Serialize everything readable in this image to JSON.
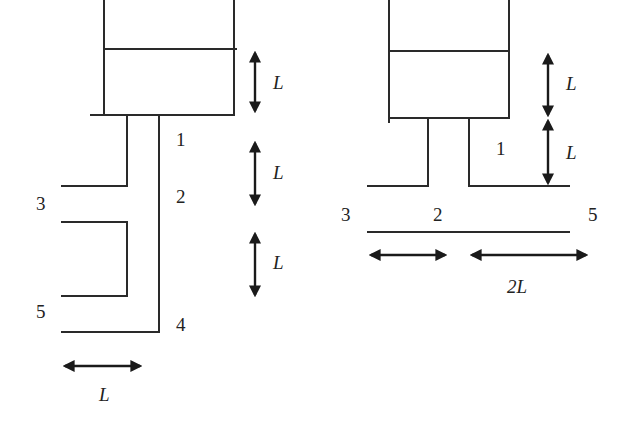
{
  "figure_left": {
    "title": "Tank with two vertical branch pipes",
    "node_labels": {
      "n1": "1",
      "n2": "2",
      "n3": "3",
      "n4": "4",
      "n5": "5"
    },
    "dimensions": {
      "tank_height": "L",
      "segment_1_2": "L",
      "segment_2_4": "L",
      "pipe_spacing": "L"
    }
  },
  "figure_right": {
    "title": "Tank with horizontal branch pipes",
    "node_labels": {
      "n1": "1",
      "n2": "2",
      "n3": "3",
      "n5": "5"
    },
    "dimensions": {
      "tank_height": "L",
      "pipe_height": "L",
      "left_length": "",
      "right_length": "2L"
    }
  },
  "colors": {
    "stroke": "#2a2a2a",
    "background": "#ffffff"
  }
}
